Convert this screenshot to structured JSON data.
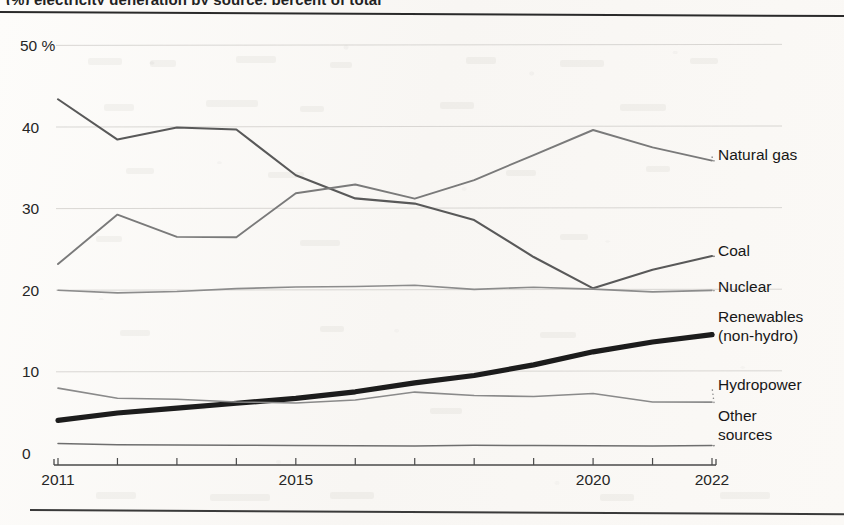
{
  "figure": {
    "title_partial": "(%)   electricity generation by source,  percent of total",
    "rule_top": "top-divider",
    "rule_bottom": "bottom-divider"
  },
  "chart_data": {
    "type": "line",
    "title": "",
    "xlabel": "",
    "ylabel": "",
    "unit": "%",
    "grid": true,
    "legend_position": "right-inline-with-leader-dots",
    "xlim": [
      2011,
      2022
    ],
    "ylim": [
      0,
      50
    ],
    "yticks": [
      0,
      10,
      20,
      30,
      40,
      50
    ],
    "ytick_labels": [
      "0",
      "10",
      "20",
      "30",
      "40",
      "50 %"
    ],
    "x": [
      2011,
      2012,
      2013,
      2014,
      2015,
      2016,
      2017,
      2018,
      2019,
      2020,
      2021,
      2022
    ],
    "xticks": [
      2011,
      2012,
      2013,
      2014,
      2015,
      2016,
      2017,
      2018,
      2019,
      2020,
      2021,
      2022
    ],
    "xtick_labels_shown": [
      "2011",
      "2015",
      "2020",
      "2022"
    ],
    "series": [
      {
        "name": "Coal",
        "label": "Coal",
        "color": "#595959",
        "width": 2.1,
        "style": "solid",
        "values": [
          43.3,
          38.4,
          39.9,
          39.7,
          34.0,
          31.2,
          30.6,
          28.5,
          24.0,
          20.2,
          22.5,
          24.1
        ]
      },
      {
        "name": "Natural gas",
        "label": "Natural gas",
        "color": "#7a7a7a",
        "width": 1.9,
        "style": "solid",
        "values": [
          23.1,
          29.2,
          26.5,
          26.5,
          31.8,
          32.9,
          31.2,
          33.4,
          36.5,
          39.6,
          37.5,
          35.8
        ]
      },
      {
        "name": "Nuclear",
        "label": "Nuclear",
        "color": "#8c8c8c",
        "width": 1.6,
        "style": "solid",
        "values": [
          19.9,
          19.6,
          19.8,
          20.2,
          20.3,
          20.4,
          20.6,
          20.0,
          20.3,
          20.1,
          19.8,
          19.9
        ]
      },
      {
        "name": "Renewables (non-hydro)",
        "label": "Renewables\n(non-hydro)",
        "label_line1": "Renewables",
        "label_line2": "(non-hydro)",
        "color": "#1c1c1c",
        "width": 5.2,
        "style": "solid-with-dotted-extension",
        "values": [
          4.0,
          4.9,
          5.5,
          6.1,
          6.7,
          7.5,
          8.6,
          9.5,
          10.8,
          12.4,
          13.6,
          14.5
        ]
      },
      {
        "name": "Hydropower",
        "label": "Hydropower",
        "color": "#8a8a8a",
        "width": 1.6,
        "style": "solid",
        "values": [
          7.9,
          6.7,
          6.6,
          6.3,
          6.1,
          6.5,
          7.5,
          7.0,
          6.9,
          7.3,
          6.3,
          6.2
        ]
      },
      {
        "name": "Other sources",
        "label": "Other\nsources",
        "label_line1": "Other",
        "label_line2": "sources",
        "color": "#6e6e6e",
        "width": 1.5,
        "style": "solid",
        "values": [
          1.1,
          1.0,
          1.0,
          1.0,
          0.9,
          0.9,
          0.9,
          0.9,
          0.9,
          0.9,
          0.9,
          0.9
        ]
      }
    ]
  },
  "axis": {
    "y_labels": [
      "50 %",
      "40",
      "30",
      "20",
      "10",
      "0"
    ],
    "x_labels": [
      "2011",
      "2015",
      "2020",
      "2022"
    ]
  },
  "legend_labels": {
    "natural_gas": "Natural gas",
    "coal": "Coal",
    "nuclear": "Nuclear",
    "renewables_l1": "Renewables",
    "renewables_l2": "(non-hydro)",
    "hydropower": "Hydropower",
    "other_l1": "Other",
    "other_l2": "sources"
  },
  "colors": {
    "ink": "#1c1c1c",
    "mid": "#7a7a7a",
    "grid": "#cfcdc9",
    "paper": "#fbfaf8"
  }
}
